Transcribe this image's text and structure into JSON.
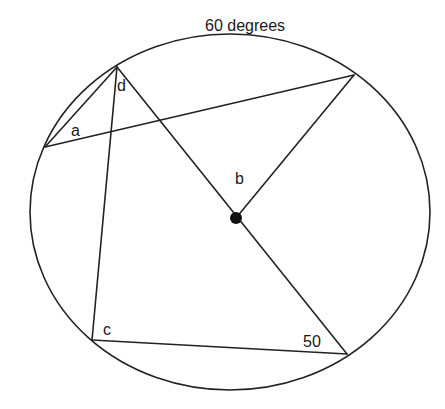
{
  "diagram": {
    "labels": {
      "top_arc": "60 degrees",
      "a": "a",
      "b": "b",
      "c": "c",
      "d": "d",
      "fifty": "50"
    },
    "circle": {
      "cx": 230,
      "cy": 212,
      "rx": 200,
      "ry": 178
    },
    "center_point": {
      "x": 236,
      "y": 218,
      "r": 6
    },
    "points": {
      "D": {
        "x": 117,
        "y": 67
      },
      "E": {
        "x": 354,
        "y": 75
      },
      "A": {
        "x": 45,
        "y": 147
      },
      "C": {
        "x": 92,
        "y": 340
      },
      "F": {
        "x": 347,
        "y": 354
      },
      "O": {
        "x": 236,
        "y": 218
      }
    },
    "segments": [
      {
        "from": "D",
        "to": "A"
      },
      {
        "from": "A",
        "to": "E"
      },
      {
        "from": "D",
        "to": "C"
      },
      {
        "from": "D",
        "to": "F"
      },
      {
        "from": "O",
        "to": "E"
      },
      {
        "from": "C",
        "to": "F"
      }
    ],
    "colors": {
      "stroke": "#222222",
      "text": "#1a1a1a",
      "background": "#ffffff"
    }
  }
}
